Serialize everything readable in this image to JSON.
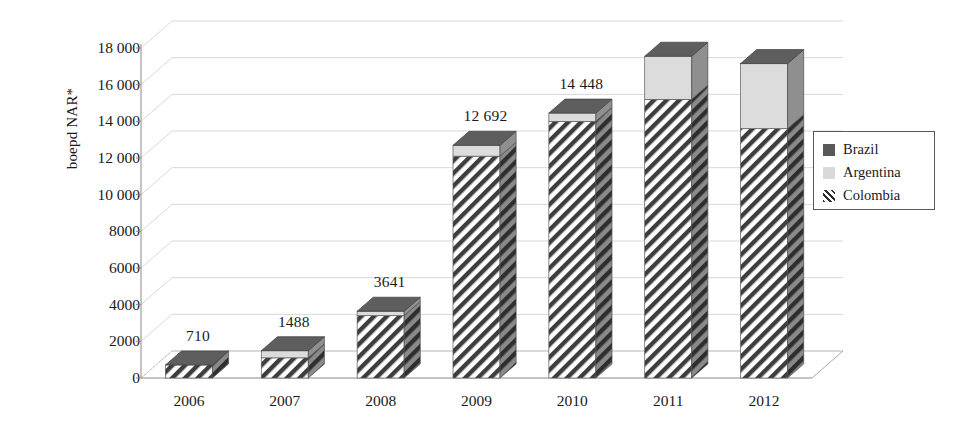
{
  "chart_data": {
    "type": "bar",
    "subtype": "stacked-3d-column",
    "title": "",
    "xlabel": "",
    "ylabel": "boepd NAR*",
    "ylim": [
      0,
      18000
    ],
    "grid": true,
    "legend_position": "right",
    "categories": [
      "2006",
      "2007",
      "2008",
      "2009",
      "2010",
      "2011",
      "2012"
    ],
    "ytick_labels": [
      "0",
      "2000",
      "4000",
      "6000",
      "8000",
      "10 000",
      "12 000",
      "14 000",
      "16 000",
      "18 000"
    ],
    "ytick_values": [
      0,
      2000,
      4000,
      6000,
      8000,
      10000,
      12000,
      14000,
      16000,
      18000
    ],
    "series": [
      {
        "name": "Colombia",
        "color": "#ffffff",
        "pattern": "diagonal-hatch",
        "values": [
          710,
          1100,
          3400,
          12100,
          14000,
          15200,
          13600
        ]
      },
      {
        "name": "Argentina",
        "color": "#d9d9d9",
        "pattern": "solid",
        "values": [
          0,
          388,
          241,
          592,
          448,
          2350,
          3550
        ]
      },
      {
        "name": "Brazil",
        "color": "#595959",
        "pattern": "solid",
        "values": [
          0,
          0,
          0,
          0,
          0,
          0,
          0
        ]
      }
    ],
    "totals": [
      710,
      1488,
      3641,
      12692,
      14448,
      17550,
      17150
    ],
    "data_labels": [
      "710",
      "1488",
      "3641",
      "12 692",
      "14 448",
      "",
      ""
    ]
  },
  "legend": {
    "items": [
      {
        "label": "Brazil",
        "swatch": "dark-gray-swatch",
        "color": "#595959"
      },
      {
        "label": "Argentina",
        "swatch": "light-gray-swatch",
        "color": "#d9d9d9"
      },
      {
        "label": "Colombia",
        "swatch": "hatched-swatch",
        "color": "#ffffff"
      }
    ]
  },
  "axes": {
    "y_title": "boepd NAR*"
  },
  "colors": {
    "accent_dark": "#595959",
    "accent_light": "#d9d9d9",
    "axis": "#808080",
    "grid": "#d6d6d6",
    "text": "#1a1a1a"
  }
}
